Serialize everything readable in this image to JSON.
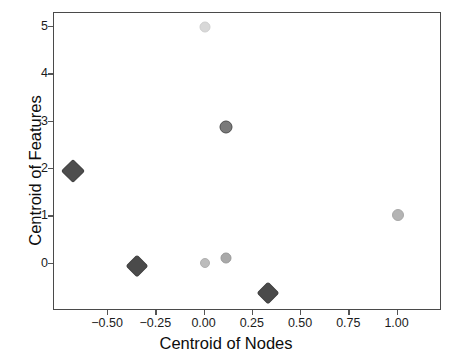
{
  "chart_data": {
    "type": "scatter",
    "title": "",
    "xlabel": "Centroid of Nodes",
    "ylabel": "Centroid of Features",
    "xlim": [
      -0.78,
      1.23
    ],
    "ylim": [
      -1.0,
      5.3
    ],
    "grid": false,
    "legend": null,
    "xticks": [
      -0.5,
      -0.25,
      0.0,
      0.25,
      0.5,
      0.75,
      1.0
    ],
    "xticklabels": [
      "−0.50",
      "−0.25",
      "0.00",
      "0.25",
      "0.50",
      "0.75",
      "1.00"
    ],
    "yticks": [
      0,
      1,
      2,
      3,
      4,
      5
    ],
    "yticklabels": [
      "0",
      "1",
      "2",
      "3",
      "4",
      "5"
    ],
    "points": [
      {
        "name": "point-top-pale",
        "x": 0.0,
        "y": 5.0,
        "marker": "circle",
        "size": 9,
        "color": "#d8d8d8",
        "edge": "#cfcfcf"
      },
      {
        "name": "point-mid-dark",
        "x": 0.11,
        "y": 2.89,
        "marker": "circle",
        "size": 11,
        "color": "#7a7a7a",
        "edge": "#4e4e4e"
      },
      {
        "name": "point-left-diamond",
        "x": -0.68,
        "y": 1.95,
        "marker": "diamond",
        "size": 15,
        "color": "#4d4d4d",
        "edge": "#3a3a3a"
      },
      {
        "name": "point-right-light",
        "x": 1.0,
        "y": 1.02,
        "marker": "circle",
        "size": 10,
        "color": "#b4b4b4",
        "edge": "#a8a8a8"
      },
      {
        "name": "point-zero-pale",
        "x": 0.0,
        "y": 0.02,
        "marker": "circle",
        "size": 8,
        "color": "#bcbcbc",
        "edge": "#b0b0b0"
      },
      {
        "name": "point-near-zero-gray",
        "x": 0.11,
        "y": 0.12,
        "marker": "circle",
        "size": 9,
        "color": "#a9a9a9",
        "edge": "#9a9a9a"
      },
      {
        "name": "point-lower-left-diamond",
        "x": -0.35,
        "y": -0.05,
        "marker": "diamond",
        "size": 14,
        "color": "#4a4a4a",
        "edge": "#383838"
      },
      {
        "name": "point-bottom-diamond",
        "x": 0.33,
        "y": -0.62,
        "marker": "diamond",
        "size": 14,
        "color": "#4a4a4a",
        "edge": "#383838"
      }
    ],
    "marker_styles": {
      "diamond_label": "diamond",
      "circle_label": "circle"
    },
    "colors": {
      "axis": "#4a4a4a",
      "tick": "#555555",
      "label_text": "#0d0d0d",
      "background": "#ffffff"
    }
  }
}
